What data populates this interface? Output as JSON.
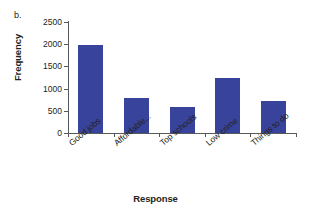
{
  "panel": {
    "letter": "b."
  },
  "chart_data": {
    "type": "bar",
    "title": "",
    "xlabel": "Response",
    "ylabel": "Frequency",
    "categories": [
      "Good jobs",
      "Affordable...",
      "Top schools",
      "Low crime",
      "Things to do"
    ],
    "values": [
      1990,
      790,
      585,
      1230,
      730
    ],
    "ylim": [
      0,
      2500
    ],
    "yticks": [
      0,
      500,
      1000,
      1500,
      2000,
      2500
    ],
    "ytick_labels": [
      "0",
      "500",
      "1000",
      "1500",
      "2000",
      "2500"
    ],
    "grid": false,
    "legend": null,
    "series": [
      {
        "name": "Frequency",
        "values": [
          1990,
          790,
          585,
          1230,
          730
        ],
        "color": "#38449b"
      }
    ],
    "colors": {
      "bar": "#38449b",
      "axis": "#58595b",
      "text": "#231f20",
      "background": "#ffffff"
    }
  }
}
